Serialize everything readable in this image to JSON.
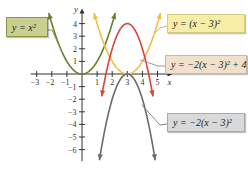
{
  "chart_data": {
    "type": "line",
    "title": "",
    "xlabel": "x",
    "ylabel": "y",
    "xlim": [
      -3.4,
      5.6
    ],
    "ylim": [
      -7,
      4.8
    ],
    "grid": false,
    "x_ticks": [
      -3,
      -2,
      -1,
      1,
      2,
      3,
      4,
      5
    ],
    "y_ticks": [
      -6,
      -5,
      -4,
      -3,
      -2,
      -1,
      1,
      2,
      3,
      4
    ],
    "x_tick_labels": [
      "−3",
      "−2",
      "−1",
      "1",
      "2",
      "3",
      "4",
      "5"
    ],
    "y_tick_labels": [
      "−6",
      "−5",
      "−4",
      "−3",
      "−2",
      "−1",
      "1",
      "2",
      "3",
      "4"
    ],
    "series": [
      {
        "name": "y = x²",
        "equation": "x^2",
        "color": "#6b7d2c",
        "x_range": [
          -2.2,
          2.2
        ],
        "vertex": [
          0,
          0
        ]
      },
      {
        "name": "y = (x − 3)²",
        "equation": "(x-3)^2",
        "color": "#f0c040",
        "x_range": [
          0.8,
          5.2
        ],
        "vertex": [
          3,
          0
        ]
      },
      {
        "name": "y = −2(x − 3)² + 4",
        "equation": "-2*(x-3)^2+4",
        "color": "#d9443a",
        "x_range": [
          1.3,
          4.7
        ],
        "vertex": [
          3,
          4
        ]
      },
      {
        "name": "y = −2(x − 3)²",
        "equation": "-2*(x-3)^2",
        "color": "#6a6a6a",
        "x_range": [
          1.15,
          4.85
        ],
        "vertex": [
          3,
          0
        ]
      }
    ],
    "annotations": [
      {
        "text": "y = x²",
        "series": 0
      },
      {
        "text": "y = (x − 3)²",
        "series": 1
      },
      {
        "text": "y = −2(x − 3)² + 4",
        "series": 2
      },
      {
        "text": "y = −2(x − 3)²",
        "series": 3
      }
    ]
  },
  "labels": {
    "parabola": "y = x²",
    "shifted": "y = (x − 3)²",
    "reflected_raised": "y = −2(x − 3)² + 4",
    "reflected": "y = −2(x − 3)²"
  },
  "colors": {
    "box_green": "#c9cf8e",
    "box_yellow": "#f6eda6",
    "box_tan": "#f1e0cc",
    "box_gray": "#d9d9d9",
    "axis": "#333333"
  }
}
